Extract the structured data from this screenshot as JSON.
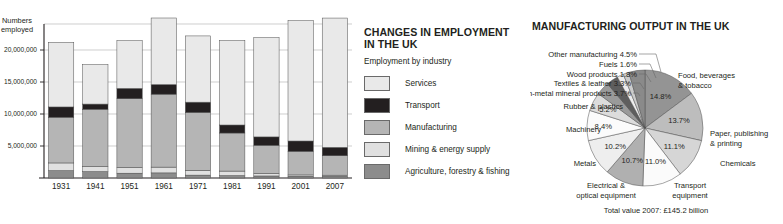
{
  "bar_panel": {
    "y_axis_title_line1": "Numbers",
    "y_axis_title_line2": "employed"
  },
  "legend_panel": {
    "title_line1": "CHANGES IN EMPLOYMENT",
    "title_line2": "IN THE UK",
    "subtitle": "Employment by industry",
    "items": [
      {
        "label": "Services",
        "color": "#e9e9e9"
      },
      {
        "label": "Transport",
        "color": "#231f20"
      },
      {
        "label": "Manufacturing",
        "color": "#b5b5b5"
      },
      {
        "label": "Mining & energy supply",
        "color": "#e0e0e0"
      },
      {
        "label": "Agriculture, forestry & fishing",
        "color": "#8c8c8c"
      }
    ]
  },
  "pie_panel": {
    "title": "MANUFACTURING OUTPUT IN THE UK",
    "total_label": "Total value 2007: £145.2 billion"
  },
  "chart_data": [
    {
      "type": "bar",
      "subtype": "stacked",
      "title": "CHANGES IN EMPLOYMENT IN THE UK",
      "subtitle": "Employment by industry",
      "xlabel": "",
      "ylabel": "Numbers employed",
      "ylim": [
        0,
        25000000
      ],
      "yticks": [
        5000000,
        10000000,
        15000000,
        20000000
      ],
      "ytick_labels": [
        "5,000,000",
        "10,000,000",
        "15,000,000",
        "20,000,000"
      ],
      "grid": true,
      "legend_position": "right",
      "categories": [
        "1931",
        "1941",
        "1951",
        "1961",
        "1971",
        "1981",
        "1991",
        "2001",
        "2007"
      ],
      "series": [
        {
          "name": "Agriculture, forestry & fishing",
          "color": "#8c8c8c",
          "values": [
            1150000,
            1000000,
            750000,
            800000,
            450000,
            380000,
            320000,
            280000,
            260000
          ]
        },
        {
          "name": "Mining & energy supply",
          "color": "#e0e0e0",
          "values": [
            1200000,
            800000,
            900000,
            900000,
            750000,
            700000,
            400000,
            200000,
            180000
          ]
        },
        {
          "name": "Manufacturing",
          "color": "#b5b5b5",
          "values": [
            7150000,
            8950000,
            10750000,
            11400000,
            9050000,
            5950000,
            4400000,
            3700000,
            3050000
          ]
        },
        {
          "name": "Transport",
          "color": "#231f20",
          "values": [
            1600000,
            800000,
            1600000,
            1500000,
            1600000,
            1250000,
            1300000,
            1600000,
            1300000
          ]
        },
        {
          "name": "Services",
          "color": "#e9e9e9",
          "values": [
            10100000,
            6150000,
            7450000,
            10400000,
            10350000,
            13200000,
            15500000,
            18800000,
            20200000
          ]
        }
      ]
    },
    {
      "type": "pie",
      "title": "MANUFACTURING OUTPUT IN THE UK",
      "annotation": "Total value 2007: £145.2 billion",
      "start_angle_deg": -90,
      "direction": "clockwise",
      "slices": [
        {
          "label": "Food, beverages & tobacco",
          "value": 14.8,
          "pct_text": "14.8%",
          "color": "#949494"
        },
        {
          "label": "Paper, publishing & printing",
          "value": 13.7,
          "pct_text": "13.7%",
          "color": "#bdbdbd"
        },
        {
          "label": "Chemicals",
          "value": 11.1,
          "pct_text": "11.1%",
          "color": "#d6d6d6"
        },
        {
          "label": "Transport equipment",
          "value": 11.0,
          "pct_text": "11.0%",
          "color": "#fbfbfb"
        },
        {
          "label": "Electrical & optical equipment",
          "value": 10.7,
          "pct_text": "10.7%",
          "color": "#b0b0b0"
        },
        {
          "label": "Metals",
          "value": 10.2,
          "pct_text": "10.2%",
          "color": "#eeeeee"
        },
        {
          "label": "Machinery",
          "value": 8.4,
          "pct_text": "8.4%",
          "color": "#fbfbfb"
        },
        {
          "label": "Rubber & plastics",
          "value": 5.2,
          "pct_text": "5.2%",
          "color": "#dcdcdc"
        },
        {
          "label": "Non-metal mineral products",
          "value": 3.7,
          "pct_text": "3.7%",
          "color": "#9a9a9a"
        },
        {
          "label": "Textiles & leather",
          "value": 3.3,
          "pct_text": "3.3%",
          "color": "#5e5e5e"
        },
        {
          "label": "Wood products",
          "value": 1.8,
          "pct_text": "1.8%",
          "color": "#ededed"
        },
        {
          "label": "Fuels",
          "value": 1.6,
          "pct_text": "1.6%",
          "color": "#cccccc"
        },
        {
          "label": "Other manufacturing",
          "value": 4.5,
          "pct_text": "4.5%",
          "color": "#8a8a8a"
        }
      ],
      "outside_labels": [
        {
          "text": "Other manufacturing 4.5%",
          "align": "end"
        },
        {
          "text": "Fuels 1.6%",
          "align": "end"
        },
        {
          "text": "Wood products 1.8%",
          "align": "end"
        },
        {
          "text": "Textiles & leather 3.3%",
          "align": "end"
        },
        {
          "text": "Non-metal mineral products 3.7%",
          "align": "end"
        },
        {
          "text": "Rubber & plastics",
          "align": "end"
        },
        {
          "text": "Machinery",
          "align": "end"
        },
        {
          "text": "Metals",
          "align": "end"
        },
        {
          "text": "Electrical &",
          "align": "middle"
        },
        {
          "text": "optical equipment",
          "align": "middle"
        },
        {
          "text": "Transport",
          "align": "middle"
        },
        {
          "text": "equipment",
          "align": "middle"
        },
        {
          "text": "Chemicals",
          "align": "start"
        },
        {
          "text": "Paper, publishing",
          "align": "start"
        },
        {
          "text": "& printing",
          "align": "start"
        },
        {
          "text": "Food, beverages",
          "align": "start"
        },
        {
          "text": "& tobacco",
          "align": "start"
        }
      ]
    }
  ]
}
